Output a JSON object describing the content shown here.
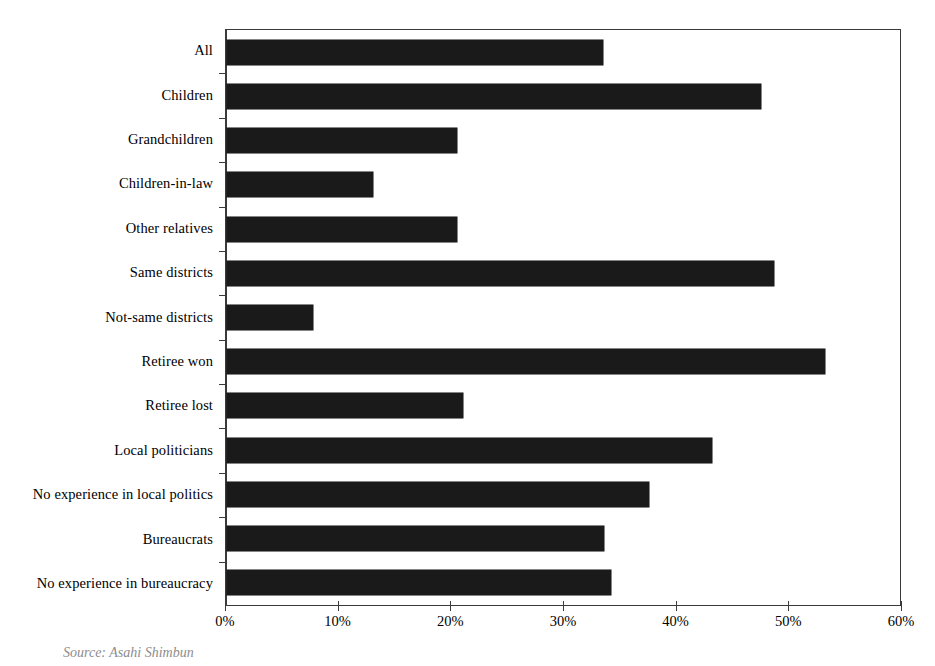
{
  "chart_data": {
    "type": "bar",
    "orientation": "horizontal",
    "title": "",
    "subtitle": "",
    "xlabel": "",
    "ylabel": "",
    "xlim": [
      0,
      60
    ],
    "xtick_values": [
      0,
      10,
      20,
      30,
      40,
      50,
      60
    ],
    "xtick_labels": [
      "0%",
      "10%",
      "20%",
      "30%",
      "40%",
      "50%",
      "60%"
    ],
    "grid": false,
    "legend": false,
    "bar_color": "#1a1a1a",
    "axis_color": "#3a3a3a",
    "categories": [
      "All",
      "Children",
      "Grandchildren",
      "Children-in-law",
      "Other relatives",
      "Same districts",
      "Not-same districts",
      "Retiree won",
      "Retiree lost",
      "Local politicians",
      "No experience in local politics",
      "Bureaucrats",
      "No experience in bureaucracy"
    ],
    "values": [
      33.5,
      47.6,
      20.5,
      13.0,
      20.5,
      48.8,
      7.7,
      53.3,
      21.0,
      43.2,
      37.6,
      33.6,
      34.2
    ],
    "value_unit": "%"
  },
  "source": {
    "note": "Source: Asahi Shimbun"
  }
}
